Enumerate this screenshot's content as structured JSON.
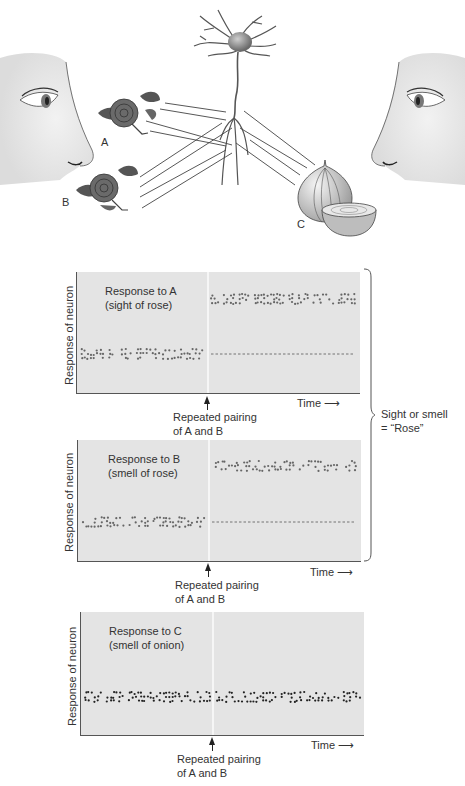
{
  "illustration": {
    "labels": {
      "a": "A",
      "b": "B",
      "c": "C"
    },
    "elements": [
      "left-face-eye-nose",
      "rose-a",
      "rose-b",
      "neuron",
      "onion-c",
      "right-face-eye-nose"
    ]
  },
  "panels": [
    {
      "title_line1": "Response to A",
      "title_line2": "(sight of rose)",
      "ylabel": "Response of neuron",
      "xlabel": "Time",
      "arrow_note": "Repeated pairing\nof A and B"
    },
    {
      "title_line1": "Response to B",
      "title_line2": "(smell of rose)",
      "ylabel": "Response of neuron",
      "xlabel": "Time",
      "arrow_note": "Repeated pairing\nof A and B"
    },
    {
      "title_line1": "Response to C",
      "title_line2": "(smell of onion)",
      "ylabel": "Response of neuron",
      "xlabel": "Time",
      "arrow_note": "Repeated pairing\nof A and B"
    }
  ],
  "brace_note": "Sight or smell\n= “Rose”",
  "chart_data": [
    {
      "type": "scatter",
      "title": "Response to A (sight of rose)",
      "xlabel": "Time",
      "ylabel": "Response of neuron",
      "event": "Repeated pairing of A and B",
      "segments": [
        {
          "phase": "before pairing",
          "level": "low"
        },
        {
          "phase": "after pairing",
          "level": "high",
          "baseline_dashed": "low"
        }
      ]
    },
    {
      "type": "scatter",
      "title": "Response to B (smell of rose)",
      "xlabel": "Time",
      "ylabel": "Response of neuron",
      "event": "Repeated pairing of A and B",
      "segments": [
        {
          "phase": "before pairing",
          "level": "low"
        },
        {
          "phase": "after pairing",
          "level": "high",
          "baseline_dashed": "low"
        }
      ]
    },
    {
      "type": "scatter",
      "title": "Response to C (smell of onion)",
      "xlabel": "Time",
      "ylabel": "Response of neuron",
      "event": "Repeated pairing of A and B",
      "segments": [
        {
          "phase": "before pairing",
          "level": "low"
        },
        {
          "phase": "after pairing",
          "level": "low"
        }
      ]
    }
  ]
}
